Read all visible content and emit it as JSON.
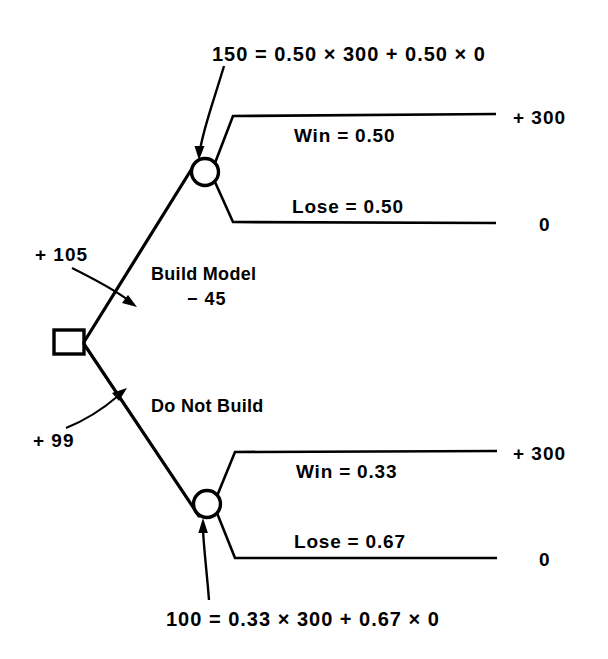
{
  "diagram": {
    "type": "decision-tree",
    "title": "",
    "nodes": {
      "decision": {
        "shape": "square",
        "label": ""
      },
      "chance_build": {
        "shape": "circle",
        "expected_value": "150"
      },
      "chance_no_build": {
        "shape": "circle",
        "expected_value": "100"
      }
    },
    "ev_annotations": {
      "build_formula": "150 = 0.50 × 300 + 0.50 × 0",
      "no_build_formula": "100 = 0.33 × 300 + 0.67 × 0"
    },
    "branches": {
      "build": {
        "label": "Build Model",
        "cost": "− 45",
        "net_value": "+ 105",
        "outcomes": [
          {
            "label": "Win = 0.50",
            "payoff": "+ 300"
          },
          {
            "label": "Lose = 0.50",
            "payoff": "0"
          }
        ]
      },
      "no_build": {
        "label": "Do Not Build",
        "cost": "",
        "net_value": "+ 99",
        "outcomes": [
          {
            "label": "Win = 0.33",
            "payoff": "+ 300"
          },
          {
            "label": "Lose = 0.67",
            "payoff": "0"
          }
        ]
      }
    }
  }
}
